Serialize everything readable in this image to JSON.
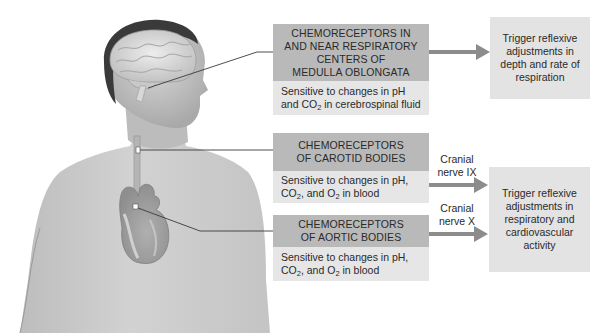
{
  "diagram": {
    "illustration": {
      "subject": "human-head-and-torso",
      "labeled_structures": [
        "brain",
        "medulla-oblongata",
        "carotid-artery",
        "heart",
        "aortic-arch"
      ]
    },
    "receptors": [
      {
        "id": "medulla",
        "header_lines": [
          "CHEMORECEPTORS IN",
          "AND NEAR RESPIRATORY",
          "CENTERS OF",
          "MEDULLA OBLONGATA"
        ],
        "sensitivity": {
          "line1": "Sensitive to changes in pH",
          "line2_pre": "and CO",
          "line2_sub": "2",
          "line2_post": " in cerebrospinal fluid"
        }
      },
      {
        "id": "carotid",
        "header_lines": [
          "CHEMORECEPTORS",
          "OF CAROTID BODIES"
        ],
        "sensitivity": {
          "line1": "Sensitive to changes in pH,",
          "line2_a": "CO",
          "line2_a_sub": "2",
          "line2_b": ", and O",
          "line2_b_sub": "2",
          "line2_c": " in blood"
        },
        "nerve": [
          "Cranial",
          "nerve IX"
        ]
      },
      {
        "id": "aortic",
        "header_lines": [
          "CHEMORECEPTORS",
          "OF AORTIC BODIES"
        ],
        "sensitivity": {
          "line1": "Sensitive to changes in pH,",
          "line2_a": "CO",
          "line2_a_sub": "2",
          "line2_b": ", and O",
          "line2_b_sub": "2",
          "line2_c": " in blood"
        },
        "nerve": [
          "Cranial",
          "nerve X"
        ]
      }
    ],
    "responses": [
      {
        "id": "respiration",
        "lines": [
          "Trigger reflexive",
          "adjustments in",
          "depth and rate of",
          "respiration"
        ]
      },
      {
        "id": "cardio",
        "lines": [
          "Trigger reflexive",
          "adjustments in",
          "respiratory and",
          "cardiovascular",
          "activity"
        ]
      }
    ],
    "colors": {
      "header_box": "#b9b9b9",
      "sensitivity_box": "#e6e6e6",
      "response_box": "#e3e3e3",
      "arrow": "#8c8c8c",
      "leader_line": "#3a3a3a"
    }
  }
}
